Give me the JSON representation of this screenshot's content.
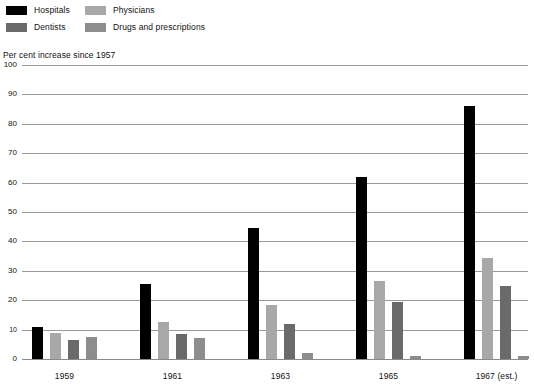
{
  "legend": {
    "items": [
      {
        "label": "Hospitals",
        "color": "#000000",
        "key": "hospitals"
      },
      {
        "label": "Physicians",
        "color": "#a8a8a8",
        "key": "physicians"
      },
      {
        "label": "Dentists",
        "color": "#6a6a6a",
        "key": "dentists"
      },
      {
        "label": "Drugs and prescriptions",
        "color": "#8d8d8d",
        "key": "drugs"
      }
    ]
  },
  "caption": "Per cent increase since 1957",
  "chart_data": {
    "type": "bar",
    "title": "Per cent increase since 1957",
    "xlabel": "",
    "ylabel": "",
    "ylim": [
      0,
      100
    ],
    "yticks": [
      0,
      10,
      20,
      30,
      40,
      50,
      60,
      70,
      80,
      90,
      100
    ],
    "grid": true,
    "legend_position": "top-left",
    "categories": [
      "1959",
      "1961",
      "1963",
      "1965",
      "1967 (est.)"
    ],
    "series": [
      {
        "name": "Hospitals",
        "color": "#000000",
        "values": [
          11,
          25.5,
          44.5,
          62,
          86
        ]
      },
      {
        "name": "Physicians",
        "color": "#a8a8a8",
        "values": [
          9,
          12.5,
          18.5,
          26.5,
          34.5
        ]
      },
      {
        "name": "Dentists",
        "color": "#6a6a6a",
        "values": [
          6.5,
          8.5,
          12,
          19.5,
          25
        ]
      },
      {
        "name": "Drugs and prescriptions",
        "color": "#8d8d8d",
        "values": [
          7.5,
          7,
          2,
          1,
          1
        ]
      }
    ]
  }
}
